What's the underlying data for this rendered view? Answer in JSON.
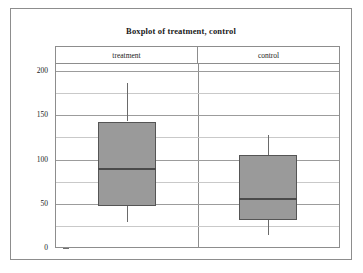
{
  "chart_data": {
    "type": "box",
    "title": "Boxplot of treatment, control",
    "xlabel": "",
    "ylabel": "",
    "ylim": [
      0,
      208
    ],
    "grid": true,
    "legend_position": "none",
    "y_ticks_major": [
      0,
      50,
      100,
      150,
      200
    ],
    "y_tick_labels": [
      "0",
      "50",
      "100",
      "150",
      "200"
    ],
    "y_ticks_minor": [
      25,
      75,
      125,
      175
    ],
    "categories": [
      "treatment",
      "control"
    ],
    "series": [
      {
        "name": "treatment",
        "whisker_low": 29,
        "q1": 48,
        "median": 90,
        "q3": 143,
        "whisker_high": 187
      },
      {
        "name": "control",
        "whisker_low": 15,
        "q1": 32,
        "median": 57,
        "q3": 105,
        "whisker_high": 128
      }
    ],
    "colors": {
      "box_fill": "#9a9a9a",
      "box_edge": "#555555",
      "median": "#4a4a4a",
      "whisker": "#6a6a6a",
      "grid_minor": "#c9c9c9",
      "grid_major": "#9c9c9c",
      "frame": "#8d8d8d",
      "background": "#ffffff",
      "text": "#222222"
    }
  }
}
